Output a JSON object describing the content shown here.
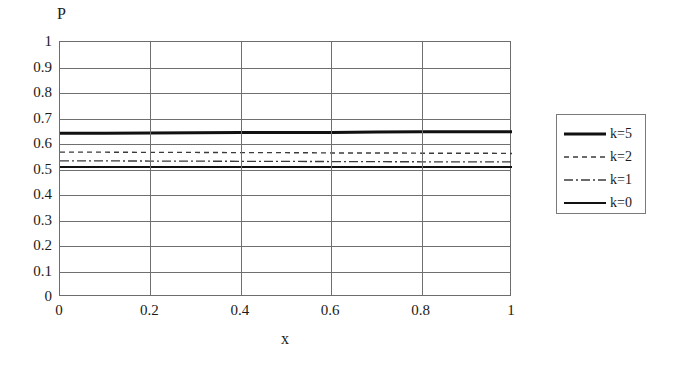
{
  "figure": {
    "top_caption_sliver": "· · · · · · · · · · · · · · · · · ·"
  },
  "legend": {
    "position": "right",
    "items": [
      {
        "label": "k=5",
        "style": "solid-thick",
        "color": "#111111"
      },
      {
        "label": "k=2",
        "style": "dotted",
        "color": "#3b3b3b"
      },
      {
        "label": "k=1",
        "style": "dashdot",
        "color": "#3b3b3b"
      },
      {
        "label": "k=0",
        "style": "solid-thin",
        "color": "#111111"
      }
    ]
  },
  "chart_data": {
    "type": "line",
    "title": "",
    "xlabel": "x",
    "ylabel": "P",
    "xlim": [
      0,
      1
    ],
    "ylim": [
      0,
      1
    ],
    "grid": true,
    "xticks": [
      "0",
      "0.2",
      "0.4",
      "0.6",
      "0.8",
      "1"
    ],
    "xtick_values": [
      0,
      0.2,
      0.4,
      0.6,
      0.8,
      1
    ],
    "yticks": [
      "1",
      "0.9",
      "0.8",
      "0.7",
      "0.6",
      "0.5",
      "0.4",
      "0.3",
      "0.2",
      "0.1",
      "0"
    ],
    "ytick_values": [
      1,
      0.9,
      0.8,
      0.7,
      0.6,
      0.5,
      0.4,
      0.3,
      0.2,
      0.1,
      0
    ],
    "x": [
      0,
      0.1,
      0.2,
      0.3,
      0.4,
      0.5,
      0.6,
      0.7,
      0.8,
      0.9,
      1
    ],
    "series": [
      {
        "name": "k=5",
        "style": "solid-thick",
        "color": "#111111",
        "width": 3,
        "values": [
          0.642,
          0.642,
          0.643,
          0.644,
          0.645,
          0.645,
          0.645,
          0.647,
          0.648,
          0.648,
          0.648
        ]
      },
      {
        "name": "k=2",
        "style": "dotted",
        "color": "#3b3b3b",
        "width": 1.4,
        "values": [
          0.568,
          0.568,
          0.567,
          0.567,
          0.566,
          0.566,
          0.565,
          0.565,
          0.564,
          0.564,
          0.563
        ]
      },
      {
        "name": "k=1",
        "style": "dashdot",
        "color": "#3b3b3b",
        "width": 1.4,
        "values": [
          0.534,
          0.534,
          0.533,
          0.533,
          0.532,
          0.532,
          0.531,
          0.531,
          0.53,
          0.53,
          0.53
        ]
      },
      {
        "name": "k=0",
        "style": "solid-thin",
        "color": "#111111",
        "width": 2,
        "values": [
          0.51,
          0.51,
          0.51,
          0.51,
          0.51,
          0.51,
          0.51,
          0.51,
          0.51,
          0.51,
          0.51
        ]
      }
    ]
  }
}
